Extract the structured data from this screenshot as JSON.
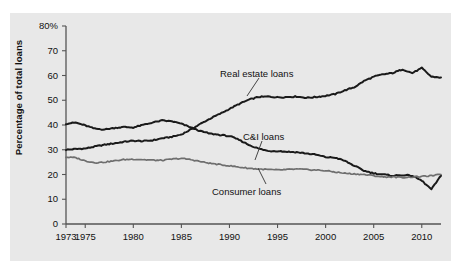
{
  "figure": {
    "background_color": "#ffffff",
    "panel_color": "#e8e8e8",
    "axis_color": "#555555",
    "line_color_dark": "#1a1a1a",
    "line_color_gray": "#6e6e6e"
  },
  "axes": {
    "ylabel": "Percentage of total loans",
    "yticks": [
      "80%",
      "70",
      "60",
      "50",
      "40",
      "30",
      "20",
      "10",
      "0"
    ],
    "ytick_values": [
      80,
      70,
      60,
      50,
      40,
      30,
      20,
      10,
      0
    ],
    "xticks": [
      "1973",
      "1975",
      "1980",
      "1985",
      "1990",
      "1995",
      "2000",
      "2005",
      "2010"
    ],
    "xtick_values": [
      1973,
      1975,
      1980,
      1985,
      1990,
      1995,
      2000,
      2005,
      2010
    ]
  },
  "annotations": [
    {
      "name": "real-estate-loans-label",
      "text": "Real estate loans"
    },
    {
      "name": "ci-loans-label",
      "text": "C&I loans"
    },
    {
      "name": "consumer-loans-label",
      "text": "Consumer loans"
    }
  ],
  "chart_data": {
    "type": "line",
    "title": "",
    "xlabel": "",
    "ylabel": "Percentage of total loans",
    "xlim": [
      1973,
      2012
    ],
    "ylim": [
      0,
      80
    ],
    "grid": false,
    "legend": "inline annotations",
    "x": [
      1973,
      1974,
      1975,
      1976,
      1977,
      1978,
      1979,
      1980,
      1981,
      1982,
      1983,
      1984,
      1985,
      1986,
      1987,
      1988,
      1989,
      1990,
      1991,
      1992,
      1993,
      1994,
      1995,
      1996,
      1997,
      1998,
      1999,
      2000,
      2001,
      2002,
      2003,
      2004,
      2005,
      2006,
      2007,
      2008,
      2009,
      2010,
      2011,
      2012
    ],
    "series": [
      {
        "name": "Real estate loans",
        "color": "#1a1a1a",
        "values": [
          30.0,
          30.3,
          30.5,
          31.3,
          32.0,
          32.6,
          33.2,
          33.6,
          33.5,
          33.8,
          34.6,
          35.2,
          36.2,
          38.2,
          40.5,
          42.6,
          44.5,
          46.5,
          48.5,
          50.2,
          51.3,
          51.5,
          51.2,
          51.3,
          51.5,
          51.0,
          51.3,
          51.8,
          52.5,
          54.0,
          55.3,
          57.8,
          59.5,
          60.5,
          61.0,
          62.5,
          61.0,
          63.0,
          59.5,
          59.2
        ]
      },
      {
        "name": "C&I loans",
        "color": "#1a1a1a",
        "values": [
          40.5,
          41.0,
          39.8,
          38.5,
          38.2,
          38.8,
          39.2,
          39.0,
          40.0,
          41.0,
          41.8,
          41.5,
          40.5,
          39.0,
          37.5,
          36.5,
          36.0,
          35.5,
          34.0,
          32.0,
          30.5,
          29.5,
          29.5,
          29.2,
          29.0,
          28.5,
          28.0,
          27.0,
          26.8,
          25.5,
          23.5,
          21.5,
          20.5,
          20.0,
          19.5,
          19.8,
          19.5,
          17.5,
          14.0,
          19.5
        ]
      },
      {
        "name": "Consumer loans",
        "color": "#6e6e6e",
        "values": [
          27.0,
          26.8,
          25.5,
          24.8,
          25.0,
          25.5,
          26.0,
          26.2,
          26.0,
          25.8,
          25.7,
          26.2,
          26.5,
          26.0,
          25.2,
          24.5,
          24.0,
          23.5,
          23.0,
          22.5,
          22.2,
          22.0,
          21.8,
          22.0,
          22.2,
          22.0,
          21.8,
          21.5,
          21.0,
          20.5,
          20.2,
          20.0,
          19.5,
          19.0,
          19.0,
          18.8,
          19.0,
          19.2,
          19.5,
          20.0
        ]
      }
    ]
  }
}
